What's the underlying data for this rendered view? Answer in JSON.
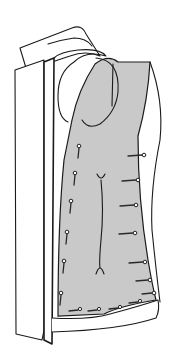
{
  "figure": {
    "width": 172,
    "height": 350,
    "colors": {
      "background": "#ffffff",
      "line": "#1a1a1a",
      "lining_shade": "#c9c9c9"
    }
  },
  "parts": {
    "collar_back": "M20 48 L72 28 Q82 24 86 34 L100 56 Q86 50 70 56 L46 64 L26 68 Z",
    "collar_front": "M48 44 Q60 40 74 38 Q86 38 92 46",
    "left_front_panel": "M15 70 L44 60 L44 330 L42 340 L16 334 Z",
    "lapel_panel": "M44 62 L54 58 L52 344 L44 340 Z",
    "facing_curve": "M54 58 Q60 52 78 50 Q100 48 106 56 Q86 50 74 62 Q58 72 58 96 Q58 118 68 122",
    "lining": "M72 120 Q78 90 95 64 Q108 54 118 62 L150 62 Q148 100 138 136 Q138 200 148 260 Q152 284 156 300 Q120 306 104 314 L58 316 Q58 220 64 160 Z",
    "right_side_edge": "M150 62 Q164 100 160 140 Q150 190 152 230 Q156 270 160 302",
    "hem_front": "M52 318 Q90 320 110 314 Q140 306 158 300 Q160 310 156 318 Q120 330 52 332",
    "neck_loop": "M96 58 Q120 60 118 92 Q116 112 100 124 Q88 130 82 120",
    "strap": "M113 64 L112 106"
  },
  "pins_center_front": [
    {
      "x": 79,
      "y": 148
    },
    {
      "x": 75,
      "y": 175
    },
    {
      "x": 71,
      "y": 203
    },
    {
      "x": 67,
      "y": 234
    },
    {
      "x": 64,
      "y": 263
    },
    {
      "x": 61,
      "y": 295
    }
  ],
  "pins_side_seam": [
    {
      "x": 142,
      "y": 155,
      "len": 14
    },
    {
      "x": 136,
      "y": 180,
      "len": 14
    },
    {
      "x": 134,
      "y": 205,
      "len": 14
    },
    {
      "x": 133,
      "y": 233,
      "len": 14
    },
    {
      "x": 143,
      "y": 262,
      "len": 14
    },
    {
      "x": 148,
      "y": 280,
      "len": 12
    },
    {
      "x": 152,
      "y": 293,
      "len": 10
    }
  ],
  "pins_hem": [
    {
      "x": 78,
      "y": 310
    },
    {
      "x": 97,
      "y": 310
    },
    {
      "x": 118,
      "y": 308
    },
    {
      "x": 138,
      "y": 302
    }
  ],
  "dart": {
    "path": "M101 180 Q104 210 101 240 Q99 262 100 268",
    "top_fork": "M97 174 Q101 182 105 174",
    "bottom_fork": "M96 274 Q100 262 104 274"
  }
}
